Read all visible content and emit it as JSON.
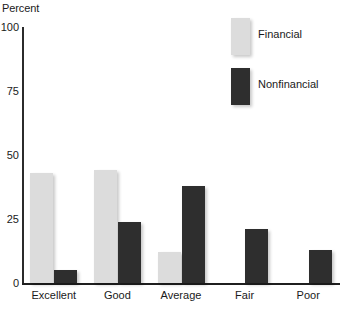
{
  "chart_data": {
    "type": "bar",
    "title": "",
    "subtitle": "",
    "xlabel": "",
    "ylabel": "Percent",
    "ylim": [
      0,
      100
    ],
    "yticks": [
      0,
      25,
      50,
      75,
      100
    ],
    "ytick_labels": [
      "0",
      "25",
      "50",
      "75",
      "100"
    ],
    "grid": false,
    "legend_position": "top-right",
    "categories": [
      "Excellent",
      "Good",
      "Average",
      "Fair",
      "Poor"
    ],
    "series": [
      {
        "name": "Financial",
        "color": "#dcdcdc",
        "values": [
          43,
          44,
          12,
          0,
          0
        ]
      },
      {
        "name": "Nonfinancial",
        "color": "#2e2e2e",
        "values": [
          5,
          24,
          38,
          21,
          13
        ]
      }
    ],
    "annotations": []
  },
  "legend": {
    "items": [
      {
        "label": "Financial",
        "swatch": "light-gray-swatch"
      },
      {
        "label": "Nonfinancial",
        "swatch": "dark-gray-swatch"
      }
    ]
  }
}
